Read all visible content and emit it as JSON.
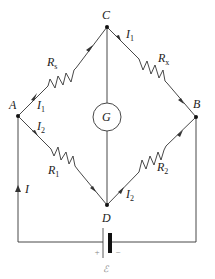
{
  "diagram": {
    "colors": {
      "wire": "#333333",
      "background": "#ffffff",
      "node": "#111111"
    },
    "nodes": {
      "A": {
        "label": "A",
        "x": 18,
        "y": 116
      },
      "B": {
        "label": "B",
        "x": 196,
        "y": 117
      },
      "C": {
        "label": "C",
        "x": 107,
        "y": 27
      },
      "D": {
        "label": "D",
        "x": 107,
        "y": 205
      }
    },
    "resistors": {
      "rs": {
        "symbol": "R",
        "subscript": "s",
        "branch": "A-C"
      },
      "rx": {
        "symbol": "R",
        "subscript": "x",
        "branch": "C-B"
      },
      "r1": {
        "symbol": "R",
        "subscript": "1",
        "branch": "A-D"
      },
      "r2": {
        "symbol": "R",
        "subscript": "2",
        "branch": "D-B"
      }
    },
    "galvanometer": {
      "label": "G",
      "branch": "C-D"
    },
    "currents": {
      "i1_ac": {
        "symbol": "I",
        "subscript": "1"
      },
      "i1_cb": {
        "symbol": "I",
        "subscript": "1"
      },
      "i2_ad": {
        "symbol": "I",
        "subscript": "2"
      },
      "i2_db": {
        "symbol": "I",
        "subscript": "2"
      },
      "i_total": {
        "symbol": "I"
      }
    },
    "battery": {
      "plus": "+",
      "minus": "−",
      "emf_label": "ℰ"
    }
  }
}
